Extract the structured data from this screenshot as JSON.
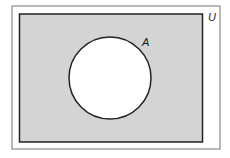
{
  "diagram": {
    "type": "venn",
    "universe_label": "U",
    "sets": [
      {
        "label": "A",
        "shaded": false
      }
    ],
    "shaded_region": "complement of A (U \\ A)",
    "colors": {
      "shade": "#d4d4d4",
      "set_fill": "#ffffff",
      "outline": "#222222",
      "outer_frame": "#888888"
    }
  }
}
